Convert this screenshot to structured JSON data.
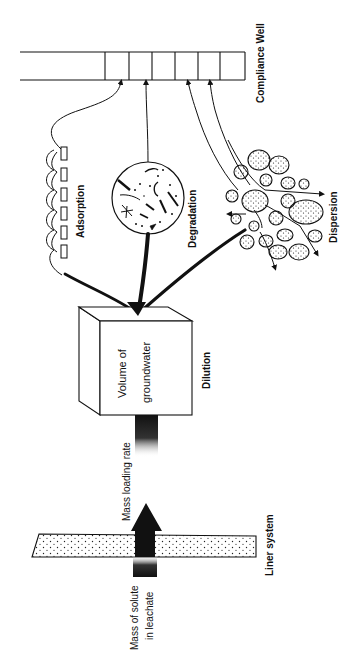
{
  "diagram": {
    "nodes": {
      "compliance_well": {
        "label": "Compliance Well",
        "segments": 6
      },
      "adsorption": {
        "label": "Adsorption"
      },
      "degradation": {
        "label": "Degradation"
      },
      "dispersion": {
        "label": "Dispersion"
      },
      "groundwater_box": {
        "label_line1": "Volume of",
        "label_line2": "groundwater"
      },
      "dilution": {
        "label": "Dilution"
      },
      "mass_loading": {
        "label": "Mass loading rate"
      },
      "liner": {
        "label": "Liner system"
      },
      "leachate": {
        "label_line1": "Mass of solute",
        "label_line2": "in leachate"
      }
    },
    "edges": [
      {
        "from": "leachate",
        "to": "groundwater_box",
        "label": "Mass loading rate"
      },
      {
        "from": "groundwater_box",
        "to": "adsorption"
      },
      {
        "from": "groundwater_box",
        "to": "degradation"
      },
      {
        "from": "groundwater_box",
        "to": "dispersion"
      },
      {
        "from": "adsorption",
        "to": "compliance_well"
      },
      {
        "from": "degradation",
        "to": "compliance_well"
      },
      {
        "from": "dispersion",
        "to": "compliance_well"
      }
    ],
    "colors": {
      "ink": "#111111",
      "background": "#ffffff"
    }
  }
}
